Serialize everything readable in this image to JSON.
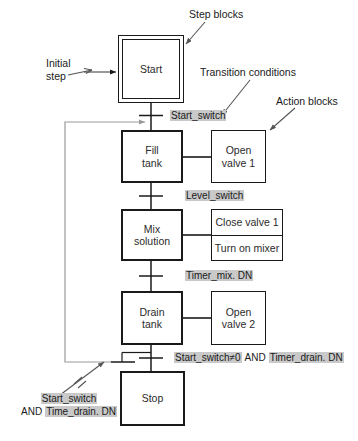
{
  "diagram": {
    "colors": {
      "line": "#1a1a1a",
      "loop_line": "#8c8c8c",
      "highlight": "#c9c9c9",
      "background": "#ffffff",
      "text": "#1a1a1a"
    }
  },
  "annotations": [
    {
      "id": "step-blocks",
      "text": "Step blocks"
    },
    {
      "id": "initial-step",
      "line1": "Initial",
      "line2": "step"
    },
    {
      "id": "transition-conditions",
      "text": "Transition conditions"
    },
    {
      "id": "action-blocks",
      "text": "Action blocks"
    }
  ],
  "steps": [
    {
      "id": "start",
      "line1": "Start",
      "line2": "",
      "initial": true
    },
    {
      "id": "fill-tank",
      "line1": "Fill",
      "line2": "tank",
      "initial": false
    },
    {
      "id": "mix-solution",
      "line1": "Mix",
      "line2": "solution",
      "initial": false
    },
    {
      "id": "drain-tank",
      "line1": "Drain",
      "line2": "tank",
      "initial": false
    },
    {
      "id": "stop",
      "line1": "Stop",
      "line2": "",
      "initial": false
    }
  ],
  "actions": [
    {
      "id": "open-valve-1",
      "rows": [
        "Open valve 1"
      ],
      "line1": "Open",
      "line2": "valve 1"
    },
    {
      "id": "mix-actions",
      "rows": [
        "Close valve 1",
        "Turn on mixer"
      ],
      "row1": "Close valve 1",
      "row2": "Turn on mixer"
    },
    {
      "id": "open-valve-2",
      "rows": [
        "Open valve 2"
      ],
      "line1": "Open",
      "line2": "valve 2"
    }
  ],
  "transitions": [
    {
      "id": "t1",
      "label": "Start_switch"
    },
    {
      "id": "t2",
      "label": "Level_switch"
    },
    {
      "id": "t3",
      "label": "Timer_mix. DN"
    },
    {
      "id": "t4",
      "part1": "Start_switch≠0",
      "conj": "AND",
      "part2": "Timer_drain. DN"
    },
    {
      "id": "t5",
      "part1": "Start_switch",
      "conj": "AND",
      "part2": "Time_drain. DN"
    }
  ]
}
